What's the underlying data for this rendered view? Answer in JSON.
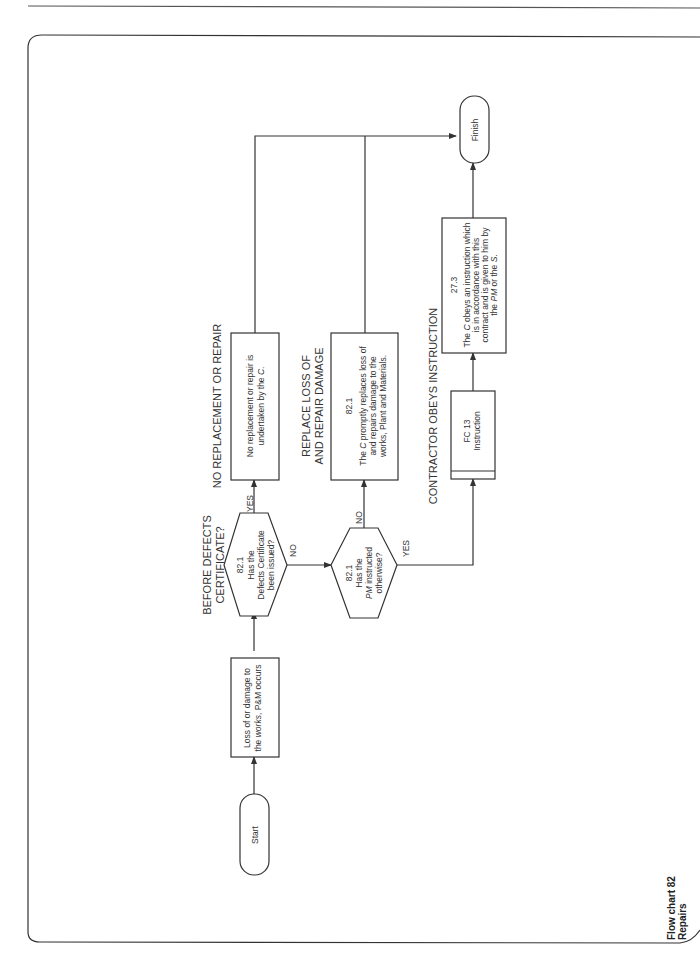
{
  "caption": {
    "line1": "Flow chart 82",
    "line2": "Repairs"
  },
  "headings": {
    "before_defects": {
      "line1": "BEFORE DEFECTS",
      "line2": "CERTIFICATE?"
    },
    "no_replacement": "NO REPLACEMENT OR REPAIR",
    "replace_loss": {
      "line1": "REPLACE LOSS OF",
      "line2": "AND REPAIR DAMAGE"
    },
    "contractor_obeys": "CONTRACTOR OBEYS INSTRUCTION"
  },
  "nodes": {
    "start": "Start",
    "finish": "Finish",
    "loss_event": {
      "line1": "Loss of or damage to",
      "line2_pre": "the ",
      "line2_em": "works",
      "line2_post": ", P&M occurs"
    },
    "decision_defects": {
      "clause": "82.1",
      "line1": "Has the",
      "line2": "Defects Certificate",
      "line3": "been issued?"
    },
    "no_repair": {
      "line1": "No replacement or repair is",
      "line2_pre": "undertaken by the ",
      "line2_em": "C",
      "line2_post": "."
    },
    "decision_pm": {
      "clause": "82.1",
      "line1": "Has the",
      "line2_em": "PM",
      "line2_post": " instructed",
      "line3": "otherwise?"
    },
    "replace_box": {
      "clause": "82.1",
      "line1_pre": "The ",
      "line1_em": "C",
      "line1_post": " promptly replaces loss of",
      "line2": "and repairs damage to the",
      "line3": "works, Plant and Materials."
    },
    "fc13": {
      "line1": "FC 13",
      "line2": "Instruction"
    },
    "obey_box": {
      "clause": "27.3",
      "line1_pre": "The ",
      "line1_em": "C",
      "line1_post": " obeys an instruction which",
      "line2": "is in accordance with this",
      "line3": "contract and is given to him by",
      "line4_pre": "the ",
      "line4_em": "PM",
      "line4_mid": " or the ",
      "line4_em2": "S",
      "line4_post": "."
    }
  },
  "edge_labels": {
    "yes1": "YES",
    "no1": "NO",
    "no2": "NO",
    "yes2": "YES"
  }
}
